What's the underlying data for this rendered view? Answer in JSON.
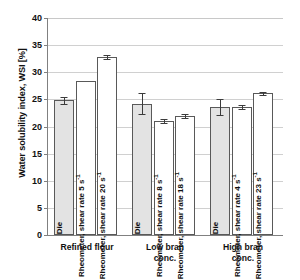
{
  "chart_data": {
    "type": "bar",
    "title": "",
    "xlabel": "",
    "ylabel": "Water solubility index, WSI [%]",
    "ylim": [
      0,
      40
    ],
    "ytick_step": 5,
    "yticks": [
      "0",
      "5",
      "10",
      "15",
      "20",
      "25",
      "30",
      "35",
      "40"
    ],
    "grid": true,
    "legend": "none",
    "categories": [
      "Refined flour",
      "Low bran conc.",
      "High bran conc."
    ],
    "bar_labels": [
      [
        "Die",
        "Rheometer, shear rate 5 s-1",
        "Rheometer, shear rate 20 s-1"
      ],
      [
        "Die",
        "Rheometer, shear rate 8 s-1",
        "Rheometer, shear rate 18 s-1"
      ],
      [
        "Die",
        "Rheometer, shear rate 4 s-1",
        "Rheometer, shear rate 23 s-1"
      ]
    ],
    "groups": [
      {
        "category": "Refined flour",
        "category_line1": "Refined flour",
        "category_line2": "",
        "bars": [
          {
            "label_main": "Die",
            "label_sup": "",
            "value": 24.8,
            "error": 0.6,
            "fill": "gray"
          },
          {
            "label_main": "Rheometer, shear rate 5 s",
            "label_sup": "-1",
            "value": 28.3,
            "error": 0.0,
            "fill": "white"
          },
          {
            "label_main": "Rheometer, shear rate 20 s",
            "label_sup": "-1",
            "value": 32.8,
            "error": 0.3,
            "fill": "white"
          }
        ]
      },
      {
        "category": "Low bran conc.",
        "category_line1": "Low bran",
        "category_line2": "conc.",
        "bars": [
          {
            "label_main": "Die",
            "label_sup": "",
            "value": 24.2,
            "error": 1.9,
            "fill": "gray"
          },
          {
            "label_main": "Rheometer, shear rate 8 s",
            "label_sup": "-1",
            "value": 21.0,
            "error": 0.3,
            "fill": "white"
          },
          {
            "label_main": "Rheometer, shear rate 18 s",
            "label_sup": "-1",
            "value": 21.9,
            "error": 0.4,
            "fill": "white"
          }
        ]
      },
      {
        "category": "High bran conc.",
        "category_line1": "High bran",
        "category_line2": "conc.",
        "bars": [
          {
            "label_main": "Die",
            "label_sup": "",
            "value": 23.6,
            "error": 1.5,
            "fill": "gray"
          },
          {
            "label_main": "Rheometer, shear rate 4 s",
            "label_sup": "-1",
            "value": 23.6,
            "error": 0.3,
            "fill": "white"
          },
          {
            "label_main": "Rheometer, shear rate 23 s",
            "label_sup": "-1",
            "value": 26.1,
            "error": 0.3,
            "fill": "white"
          }
        ]
      }
    ],
    "colors": {
      "bar_fill_gray": "#e3e3e3",
      "bar_fill_white": "#ffffff",
      "bar_border": "#595959",
      "gridline": "#d0d0d0",
      "axis": "#808080",
      "text": "#111111"
    }
  }
}
